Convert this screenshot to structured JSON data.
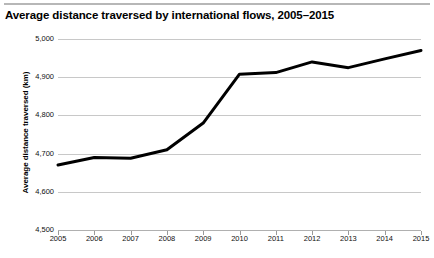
{
  "chart_data": {
    "type": "line",
    "title": "Average distance traversed by international flows, 2005–2015",
    "xlabel": "",
    "ylabel": "Average distance traversed (km)",
    "categories": [
      "2005",
      "2006",
      "2007",
      "2008",
      "2009",
      "2010",
      "2011",
      "2012",
      "2013",
      "2014",
      "2015"
    ],
    "values": [
      4670,
      4690,
      4688,
      4710,
      4780,
      4908,
      4912,
      4940,
      4925,
      4948,
      4970
    ],
    "series": [
      {
        "name": "Average distance traversed",
        "values": [
          4670,
          4690,
          4688,
          4710,
          4780,
          4908,
          4912,
          4940,
          4925,
          4948,
          4970
        ],
        "color": "#000000"
      }
    ],
    "ylim": [
      4500,
      5000
    ],
    "yticks": [
      5000,
      4900,
      4800,
      4700,
      4600,
      4500
    ],
    "ytick_labels": [
      "5,000",
      "4,900",
      "4,800",
      "4,700",
      "4,600",
      "4,500"
    ],
    "xtick_labels": [
      "2005",
      "2006",
      "2007",
      "2008",
      "2009",
      "2010",
      "2011",
      "2012",
      "2013",
      "2014",
      "2015"
    ],
    "grid": true,
    "grid_axis": "y",
    "grid_color": "#c8c8c8",
    "legend": false,
    "legend_position": "none",
    "line_width": 3,
    "background": "#ffffff"
  },
  "figure": {
    "title": "Average distance traversed by international flows, 2005–2015",
    "top_rule_color": "#b7b7b7",
    "bottom_note": ""
  }
}
